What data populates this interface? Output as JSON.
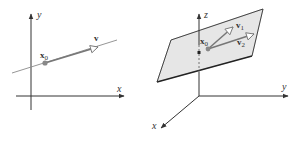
{
  "figure": {
    "left_panel": {
      "title": "line in 2D through point x0 with direction v",
      "axes": {
        "x_label": "x",
        "y_label": "y"
      },
      "point_label": {
        "main": "x",
        "sub": "0"
      },
      "vector_label": "v"
    },
    "right_panel": {
      "title": "plane in 3D through point x0 spanned by v1 and v2",
      "axes": {
        "x_label": "x",
        "y_label": "y",
        "z_label": "z"
      },
      "point_label": {
        "main": "x",
        "sub": "0"
      },
      "vector1_label": {
        "main": "v",
        "sub": "1"
      },
      "vector2_label": {
        "main": "v",
        "sub": "2"
      }
    },
    "colors": {
      "axis": "#333333",
      "line": "#8a8a8a",
      "vector": "#777777",
      "point": "#888888",
      "plane_fill": "#e6e6e6",
      "plane_edge": "#222222"
    }
  }
}
